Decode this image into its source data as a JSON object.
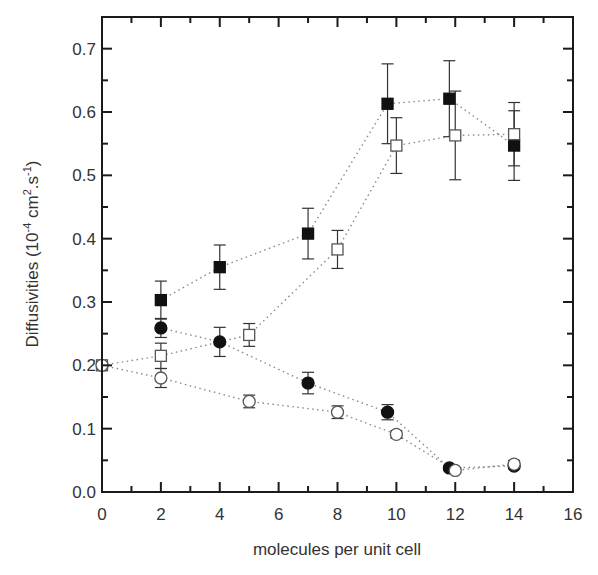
{
  "chart_data": {
    "type": "scatter",
    "title": "",
    "xlabel": "molecules per unit cell",
    "ylabel": {
      "base": "Diffusivities (10",
      "exp1": "-4",
      "mid": " cm",
      "exp2": "2",
      "mid2": ".s",
      "exp3": "-1",
      "end": ")"
    },
    "xlim": [
      0,
      16
    ],
    "ylim": [
      0,
      0.75
    ],
    "xticks": [
      "0",
      "2",
      "4",
      "6",
      "8",
      "10",
      "12",
      "14",
      "16"
    ],
    "yticks": [
      "0.0",
      "0.1",
      "0.2",
      "0.3",
      "0.4",
      "0.5",
      "0.6",
      "0.7"
    ],
    "grid": false,
    "legend": "none",
    "series": [
      {
        "name": "filled-squares",
        "marker": "square",
        "filled": true,
        "x": [
          2,
          4,
          7,
          9.7,
          11.8,
          14
        ],
        "y": [
          0.303,
          0.355,
          0.408,
          0.613,
          0.621,
          0.547
        ],
        "err": [
          0.03,
          0.035,
          0.04,
          0.063,
          0.06,
          0.055
        ]
      },
      {
        "name": "open-squares",
        "marker": "square",
        "filled": false,
        "x": [
          0,
          2,
          5,
          8,
          10,
          12,
          14
        ],
        "y": [
          0.2,
          0.215,
          0.248,
          0.383,
          0.547,
          0.563,
          0.565
        ],
        "err": [
          0,
          0.02,
          0.018,
          0.03,
          0.044,
          0.07,
          0.05
        ]
      },
      {
        "name": "filled-circles",
        "marker": "circle",
        "filled": true,
        "x": [
          2,
          4,
          7,
          9.7,
          11.8,
          14
        ],
        "y": [
          0.259,
          0.237,
          0.172,
          0.126,
          0.038,
          0.041
        ],
        "err": [
          0.015,
          0.023,
          0.017,
          0.012,
          0.004,
          0.004
        ]
      },
      {
        "name": "open-circles",
        "marker": "circle",
        "filled": false,
        "x": [
          0,
          2,
          5,
          8,
          10,
          12,
          14
        ],
        "y": [
          0.2,
          0.18,
          0.143,
          0.126,
          0.091,
          0.034,
          0.044
        ],
        "err": [
          0,
          0.015,
          0.01,
          0.01,
          0.006,
          0.004,
          0.006
        ]
      }
    ]
  }
}
